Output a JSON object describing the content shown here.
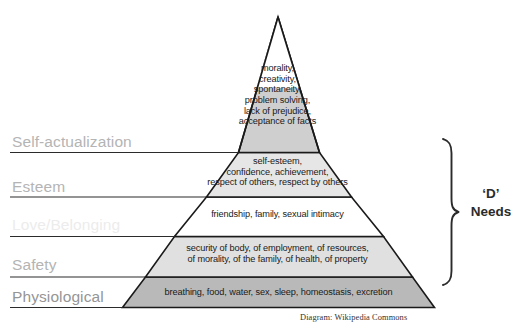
{
  "diagram": {
    "attribution": "Diagram: Wikipedia Commons",
    "bracket_label_line1": "‘D’",
    "bracket_label_line2": "Needs",
    "colors": {
      "tier_self_actualization": "#cfcfcf",
      "tier_esteem": "#e6e6e6",
      "tier_love": "#ffffff",
      "tier_safety": "#e0e0e0",
      "tier_physiological": "#b9b9b9",
      "outline": "#1a1a1a",
      "side_label": "#b4b4b4",
      "side_label_faded": "#ececec",
      "side_label_dark": "#959595",
      "bracket": "#2b2b2b",
      "background": "#ffffff"
    },
    "tiers": [
      {
        "id": "self-actualization",
        "label": "Self-actualization",
        "label_visible": true,
        "fill": "#cfcfcf",
        "items": "morality,\ncreativity,\nspontaneity,\nproblem solving,\nlack of prejudice,\nacceptance of facts"
      },
      {
        "id": "esteem",
        "label": "Esteem",
        "label_visible": true,
        "fill": "#e6e6e6",
        "items": "self-esteem,\nconfidence, achievement,\nrespect of others, respect by others"
      },
      {
        "id": "love-belonging",
        "label": "Love/Belonging",
        "label_visible": false,
        "fill": "#ffffff",
        "items": "friendship, family, sexual intimacy"
      },
      {
        "id": "safety",
        "label": "Safety",
        "label_visible": true,
        "fill": "#e0e0e0",
        "items": "security of body, of employment, of resources,\nof morality, of the family, of health, of property"
      },
      {
        "id": "physiological",
        "label": "Physiological",
        "label_visible": true,
        "fill": "#b9b9b9",
        "items": "breathing, food, water, sex, sleep, homeostasis, excretion"
      }
    ]
  }
}
